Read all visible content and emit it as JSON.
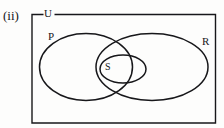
{
  "figure": {
    "index_label": "(ii)",
    "type": "venn-diagram",
    "background_color": "#fdfdfc",
    "stroke_color": "#17171a"
  },
  "universe": {
    "label": "U",
    "shape": "rectangle",
    "border_has_label_gap": true
  },
  "sets": [
    {
      "name": "P",
      "label": "P",
      "shape": "ellipse",
      "label_position": "upper-left"
    },
    {
      "name": "R",
      "label": "R",
      "shape": "ellipse",
      "label_position": "upper-right"
    },
    {
      "name": "S",
      "label": "S",
      "shape": "ellipse",
      "label_position": "inner-left"
    }
  ],
  "relations": {
    "description": "S is contained within the intersection of P and R"
  }
}
